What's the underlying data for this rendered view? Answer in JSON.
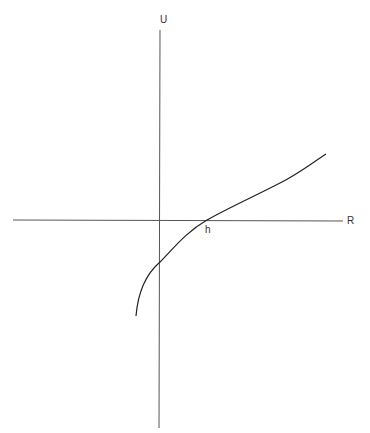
{
  "diagram": {
    "axes": {
      "vertical": {
        "label": "U",
        "x": 160,
        "y_start": 30,
        "y_end": 428
      },
      "horizontal": {
        "label": "R",
        "y": 220,
        "x_start": 13,
        "x_end": 343
      }
    },
    "annotations": {
      "intercept_label": "h"
    },
    "curve": {
      "description": "Concave curve rising from lower-left, crossing U-axis below origin, crossing R-axis at h, then nearly straight toward upper-right",
      "start": [
        136,
        316
      ],
      "u_axis_crossing": [
        160,
        262
      ],
      "r_axis_crossing_h": [
        207,
        220
      ],
      "end": [
        326,
        154
      ]
    },
    "colors": {
      "axis": "#555555",
      "curve": "#222222",
      "text": "#333333",
      "background": "#ffffff"
    }
  }
}
